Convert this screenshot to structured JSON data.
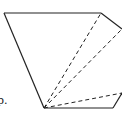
{
  "diagram": {
    "type": "geometry-figure",
    "stroke_color": "#222222",
    "background": "#ffffff",
    "vertices": {
      "A": [
        4,
        13
      ],
      "B": [
        101,
        13
      ],
      "C": [
        122,
        29
      ],
      "P": [
        44,
        108
      ],
      "D": [
        122,
        93
      ],
      "E": [
        113,
        108
      ]
    },
    "solid_edges": [
      [
        "A",
        "B"
      ],
      [
        "B",
        "C"
      ],
      [
        "A",
        "P"
      ],
      [
        "P",
        "E"
      ],
      [
        "E",
        "D"
      ]
    ],
    "dashed_edges": [
      [
        "P",
        "B"
      ],
      [
        "P",
        "C"
      ],
      [
        "P",
        "D"
      ]
    ],
    "partial_label": "p."
  }
}
